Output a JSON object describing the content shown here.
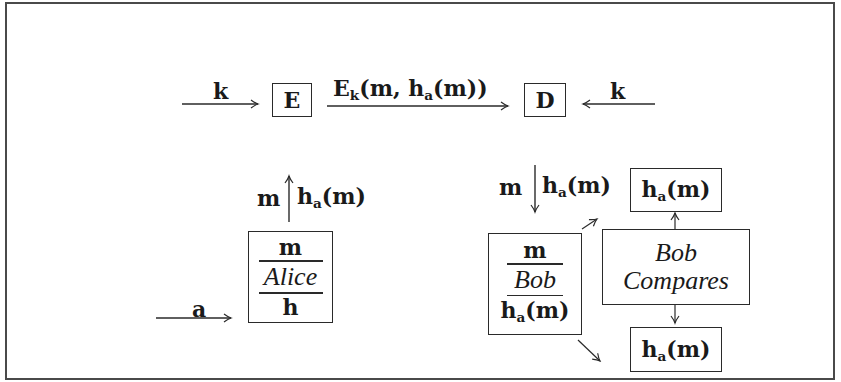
{
  "diagram": {
    "type": "cryptographic protocol flow",
    "top_row": {
      "key_in_left": {
        "label": "k",
        "direction": "right"
      },
      "encrypt_box": {
        "label": "E"
      },
      "ciphertext_arrow": {
        "label_main": "E",
        "label_sub": "k",
        "label_rest": "(m, h",
        "label_sub2": "a",
        "label_end": "(m))",
        "direction": "right"
      },
      "decrypt_box": {
        "label": "D"
      },
      "key_in_right": {
        "label": "k",
        "direction": "left"
      }
    },
    "alice": {
      "up_arrow": {
        "left_label": "m",
        "right_main": "h",
        "right_sub": "a",
        "right_rest": "(m)"
      },
      "input_arrow": {
        "label": "a"
      },
      "box": {
        "top": "m",
        "middle": "Alice",
        "bottom": "h"
      }
    },
    "bob": {
      "down_arrow": {
        "left_label": "m",
        "right_main": "h",
        "right_sub": "a",
        "right_rest": "(m)"
      },
      "box": {
        "top": "m",
        "middle": "Bob",
        "bottom_main": "h",
        "bottom_sub": "a",
        "bottom_rest": "(m)"
      },
      "hash_top": {
        "main": "h",
        "sub": "a",
        "rest": "(m)"
      },
      "compare_box": {
        "line1": "Bob",
        "line2": "Compares"
      },
      "hash_bottom": {
        "main": "h",
        "sub": "a",
        "rest": "(m)"
      }
    }
  }
}
